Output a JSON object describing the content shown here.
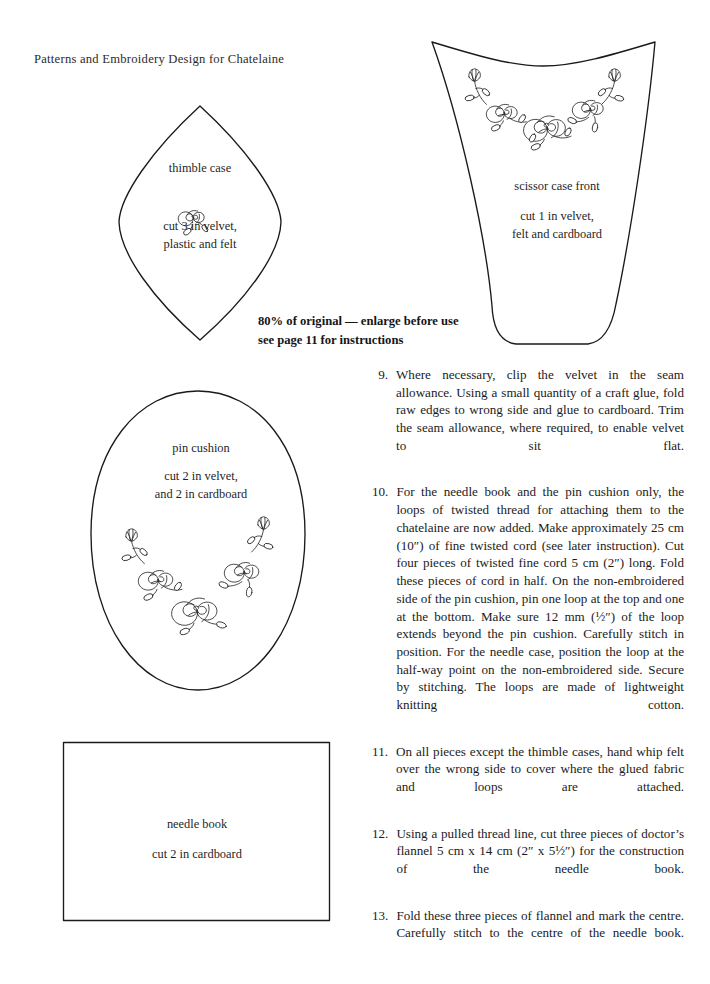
{
  "page": {
    "running_head": "Patterns and Embroidery Design for Chatelaine",
    "background_color": "#ffffff",
    "ink_color": "#1a1a1a"
  },
  "notice": {
    "line1": "80% of original — enlarge before use",
    "line2": "see page 11 for instructions"
  },
  "pattern_pieces": [
    {
      "id": "thimble-case",
      "shape": "pointed-oval",
      "title": "thimble case",
      "cut_instruction": "cut 3 in velvet,\nplastic and felt",
      "motif": "single-rose-with-leaves"
    },
    {
      "id": "scissor-case-front",
      "shape": "tapered-trapezoid",
      "title": "scissor case front",
      "cut_instruction": "cut 1 in velvet,\nfelt and cardboard",
      "motif": "rose-and-tulip-garland"
    },
    {
      "id": "pin-cushion",
      "shape": "oval",
      "title": "pin cushion",
      "cut_instruction": "cut 2 in velvet,\nand 2 in cardboard",
      "motif": "rose-and-tulip-garland"
    },
    {
      "id": "needle-book",
      "shape": "rectangle",
      "title": "needle book",
      "cut_instruction": "cut 2 in cardboard",
      "motif": "none"
    }
  ],
  "instructions": [
    {
      "number": "9.",
      "text": "Where necessary, clip the velvet in the seam allowance. Using a small quantity of a craft glue, fold raw edges to wrong side and glue to cardboard. Trim the seam allowance, where required, to enable velvet to sit flat."
    },
    {
      "number": "10.",
      "text": "For the needle book and the pin cushion only, the loops of twisted thread for attaching them to the chatelaine are now added. Make approximately 25 cm (10″) of fine twisted cord (see later instruction). Cut four pieces of twisted fine cord 5 cm (2″) long. Fold these pieces of cord in half. On the non-embroidered side of the pin cushion, pin one loop at the top and one at the bottom. Make sure 12 mm (½″) of the loop extends beyond the pin cushion. Carefully stitch in position. For the needle case, position the loop at the half-way point on the non-embroidered side. Secure by stitching. The loops are made of lightweight knitting cotton."
    },
    {
      "number": "11.",
      "text": "On all pieces except the thimble cases, hand whip felt over the wrong side to cover where the glued fabric and loops are attached."
    },
    {
      "number": "12.",
      "text": "Using a pulled thread line, cut three pieces of doctor’s flannel 5 cm x 14 cm (2″ x 5½″) for the construction of the needle book."
    },
    {
      "number": "13.",
      "text": "Fold these three pieces of flannel and mark the centre. Carefully stitch to the centre of the needle book."
    }
  ]
}
